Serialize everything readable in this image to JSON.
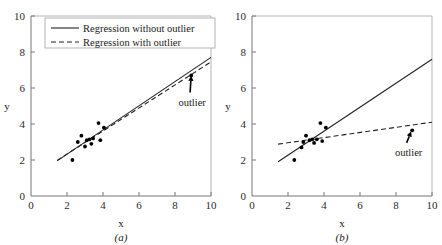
{
  "figure": {
    "background_color": "#ffffff",
    "line_color": "#222222",
    "point_color": "#000000",
    "axis_color": "#777777"
  },
  "chart_data": [
    {
      "type": "scatter",
      "panel_label": "(a)",
      "title": "",
      "xlabel": "x",
      "ylabel": "y",
      "xlim": [
        0,
        10
      ],
      "ylim": [
        0,
        10
      ],
      "xticks": [
        0,
        2,
        4,
        6,
        8,
        10
      ],
      "yticks": [
        0,
        2,
        4,
        6,
        8,
        10
      ],
      "grid": false,
      "legend_position": "top-left",
      "legend": [
        {
          "label": "Regression without outlier",
          "style": "solid"
        },
        {
          "label": "Regression with outlier",
          "style": "dashed"
        }
      ],
      "points": [
        {
          "x": 2.3,
          "y": 2.0
        },
        {
          "x": 2.6,
          "y": 3.0
        },
        {
          "x": 2.8,
          "y": 3.35
        },
        {
          "x": 3.0,
          "y": 2.75
        },
        {
          "x": 3.1,
          "y": 3.1
        },
        {
          "x": 3.25,
          "y": 3.15
        },
        {
          "x": 3.35,
          "y": 2.9
        },
        {
          "x": 3.45,
          "y": 3.2
        },
        {
          "x": 3.75,
          "y": 4.05
        },
        {
          "x": 3.85,
          "y": 3.1
        },
        {
          "x": 4.05,
          "y": 3.8
        },
        {
          "x": 8.9,
          "y": 6.7
        }
      ],
      "series": [
        {
          "name": "Regression without outlier",
          "style": "solid",
          "x": [
            1.45,
            10.0
          ],
          "y": [
            1.95,
            7.7
          ]
        },
        {
          "name": "Regression with outlier",
          "style": "dashed",
          "x": [
            1.45,
            10.0
          ],
          "y": [
            1.98,
            7.45
          ]
        }
      ],
      "annotations": [
        {
          "text": "outlier",
          "point_x": 8.9,
          "point_y": 6.7,
          "label_x": 8.95,
          "label_y": 5.25
        }
      ]
    },
    {
      "type": "scatter",
      "panel_label": "(b)",
      "title": "",
      "xlabel": "x",
      "ylabel": "y",
      "xlim": [
        0,
        10
      ],
      "ylim": [
        0,
        10
      ],
      "xticks": [
        0,
        2,
        4,
        6,
        8,
        10
      ],
      "yticks": [
        0,
        2,
        4,
        6,
        8,
        10
      ],
      "grid": false,
      "legend_position": "none",
      "legend": [],
      "points": [
        {
          "x": 2.35,
          "y": 2.0
        },
        {
          "x": 2.75,
          "y": 2.7
        },
        {
          "x": 2.85,
          "y": 3.0
        },
        {
          "x": 3.0,
          "y": 3.35
        },
        {
          "x": 3.2,
          "y": 3.1
        },
        {
          "x": 3.35,
          "y": 3.15
        },
        {
          "x": 3.45,
          "y": 2.95
        },
        {
          "x": 3.6,
          "y": 3.15
        },
        {
          "x": 3.8,
          "y": 4.05
        },
        {
          "x": 3.9,
          "y": 3.05
        },
        {
          "x": 4.1,
          "y": 3.8
        },
        {
          "x": 8.9,
          "y": 3.65
        }
      ],
      "series": [
        {
          "name": "Regression without outlier",
          "style": "solid",
          "x": [
            1.45,
            10.0
          ],
          "y": [
            1.9,
            7.6
          ]
        },
        {
          "name": "Regression with outlier",
          "style": "dashed",
          "x": [
            1.45,
            10.0
          ],
          "y": [
            2.88,
            4.1
          ]
        }
      ],
      "annotations": [
        {
          "text": "outlier",
          "point_x": 8.85,
          "point_y": 3.6,
          "label_x": 8.7,
          "label_y": 2.45
        }
      ]
    }
  ]
}
